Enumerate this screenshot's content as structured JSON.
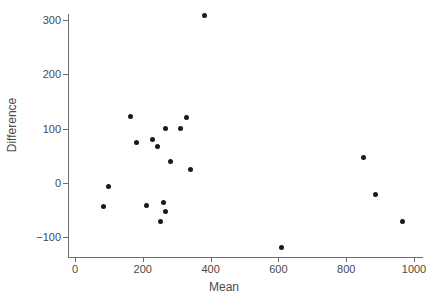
{
  "chart_data": {
    "type": "scatter",
    "title": "",
    "xlabel": "Mean",
    "ylabel": "Difference",
    "xlim": [
      0,
      1000
    ],
    "ylim": [
      -130,
      320
    ],
    "xticks": [
      0,
      200,
      400,
      600,
      800,
      1000
    ],
    "yticks": [
      -100,
      0,
      100,
      200,
      300
    ],
    "xtick_labels": [
      "0",
      "200",
      "400",
      "600",
      "800",
      "1000"
    ],
    "ytick_labels": [
      "−100",
      "0",
      "100",
      "200",
      "300"
    ],
    "grid": false,
    "legend": null,
    "marker": {
      "shape": "circle",
      "color": "#1a1a1a",
      "size": 5
    },
    "points": [
      {
        "x": 381,
        "y": 308
      },
      {
        "x": 330,
        "y": 120
      },
      {
        "x": 165,
        "y": 123
      },
      {
        "x": 310,
        "y": 100
      },
      {
        "x": 268,
        "y": 100
      },
      {
        "x": 230,
        "y": 80
      },
      {
        "x": 180,
        "y": 75
      },
      {
        "x": 850,
        "y": 47
      },
      {
        "x": 244,
        "y": 67
      },
      {
        "x": 283,
        "y": 40
      },
      {
        "x": 342,
        "y": 24
      },
      {
        "x": 100,
        "y": -6
      },
      {
        "x": 885,
        "y": -21
      },
      {
        "x": 83,
        "y": -43
      },
      {
        "x": 210,
        "y": -41
      },
      {
        "x": 260,
        "y": -36
      },
      {
        "x": 268,
        "y": -52
      },
      {
        "x": 251,
        "y": -71
      },
      {
        "x": 965,
        "y": -70
      },
      {
        "x": 610,
        "y": -118
      }
    ]
  },
  "colors": {
    "background": "#ffffff",
    "marker": "#1a1a1a",
    "axis": "#6d6d6d",
    "text": "#4a4a4a"
  }
}
